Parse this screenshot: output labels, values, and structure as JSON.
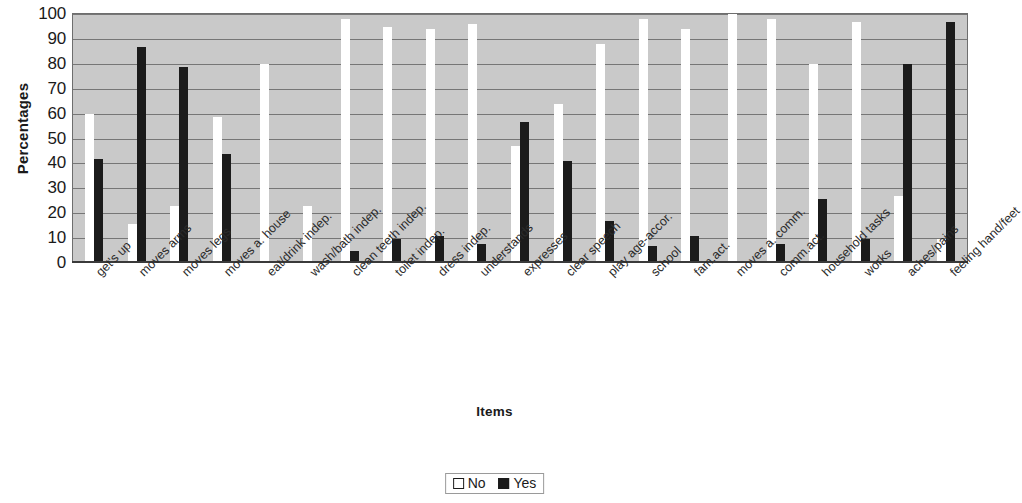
{
  "chart_data": {
    "type": "bar",
    "title": "",
    "xlabel": "Items",
    "ylabel": "Percentages",
    "ylim": [
      0,
      100
    ],
    "ytick_step": 10,
    "yticks": [
      100,
      90,
      80,
      70,
      60,
      50,
      40,
      30,
      20,
      10,
      0
    ],
    "grid": true,
    "legend_position": "bottom-center",
    "plot_background": "#c9c9c9",
    "categories": [
      "get's up",
      "moves arms",
      "moves legs",
      "moves a. house",
      "eat/drink indep.",
      "wash/bath indep.",
      "clean teeth indep.",
      "toilet indep.",
      "dress indep.",
      "understands",
      "expresses",
      "clear speech",
      "play age-accor.",
      "school",
      "fam.act.",
      "moves a. comm.",
      "comm.act.",
      "household tasks",
      "works",
      "aches/pains",
      "feeling hand/feet"
    ],
    "series": [
      {
        "name": "No",
        "color": "#ffffff",
        "values": [
          59,
          15,
          22,
          58,
          79,
          22,
          97,
          94,
          93,
          95,
          46,
          63,
          87,
          97,
          93,
          100,
          97,
          79,
          96,
          26,
          9
        ]
      },
      {
        "name": "Yes",
        "color": "#1b1b1b",
        "values": [
          41,
          86,
          78,
          43,
          0,
          0,
          4,
          9,
          10,
          7,
          56,
          40,
          16,
          6,
          10,
          0,
          7,
          25,
          9,
          79,
          96
        ]
      }
    ]
  },
  "legend": {
    "items": [
      {
        "label": "No"
      },
      {
        "label": "Yes"
      }
    ]
  }
}
